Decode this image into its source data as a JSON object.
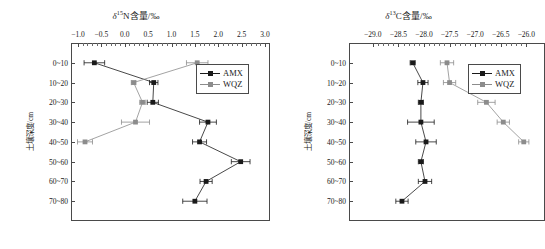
{
  "figure": {
    "panels": [
      {
        "id": "left",
        "title_prefix": "δ",
        "title_sup": "15",
        "title_rest": "N含量/‰",
        "title_plain": "δ15N含量/‰"
      },
      {
        "id": "right",
        "title_prefix": "δ",
        "title_sup": "13",
        "title_rest": "C含量/‰",
        "title_plain": "δ13C含量/‰"
      }
    ]
  },
  "legend": {
    "position": "top-right-inside",
    "items": [
      {
        "label": "AMX",
        "color": "#1a1a1a"
      },
      {
        "label": "WQZ",
        "color": "#8c8c8c"
      }
    ]
  },
  "colors": {
    "amx": "#1a1a1a",
    "wqz": "#8c8c8c",
    "axis": "#4a4a4a",
    "background": "#ffffff"
  },
  "chart_data": [
    {
      "type": "line",
      "id": "delta15N",
      "title": "δ15N含量/‰",
      "xlabel": "δ15N含量/‰",
      "ylabel": "土壤深度/cm",
      "orientation": "horizontal-value-vertical-depth",
      "xlim": [
        -1.0,
        3.0
      ],
      "xticks": [
        -1.0,
        -0.5,
        0.0,
        0.5,
        1.0,
        1.5,
        2.0,
        2.5,
        3.0
      ],
      "xtick_labels": [
        "−1.0",
        "−0.5",
        "0.0",
        "0.5",
        "1.0",
        "1.5",
        "2.0",
        "2.5",
        "3.0"
      ],
      "minor_ticks_per_interval": 4,
      "categories": [
        "0~10",
        "10~20",
        "20~30",
        "30~40",
        "40~50",
        "50~60",
        "60~70",
        "70~80"
      ],
      "grid": false,
      "legend_position": "upper right",
      "series": [
        {
          "name": "AMX",
          "color": "#1a1a1a",
          "values": [
            -0.65,
            0.62,
            0.6,
            1.78,
            1.6,
            2.48,
            1.74,
            1.5
          ],
          "errors": [
            0.22,
            0.09,
            0.12,
            0.18,
            0.15,
            0.2,
            0.13,
            0.26
          ]
        },
        {
          "name": "WQZ",
          "color": "#8c8c8c",
          "values": [
            1.55,
            0.19,
            0.38,
            0.23,
            -0.85,
            null,
            null,
            null
          ],
          "errors": [
            0.23,
            0.05,
            0.06,
            0.3,
            0.16,
            null,
            null,
            null
          ]
        }
      ]
    },
    {
      "type": "line",
      "id": "delta13C",
      "title": "δ13C含量/‰",
      "xlabel": "δ13C含量/‰",
      "ylabel": "土壤深度/cm",
      "orientation": "horizontal-value-vertical-depth",
      "xlim": [
        -29.25,
        -25.85
      ],
      "xticks": [
        -29.0,
        -28.5,
        -28.0,
        -27.5,
        -27.0,
        -26.5,
        -26.0
      ],
      "xtick_labels": [
        "−29.0",
        "−28.5",
        "−28.0",
        "−27.5",
        "−27.0",
        "−26.5",
        "−26.0"
      ],
      "minor_ticks_per_interval": 4,
      "categories": [
        "0~10",
        "10~20",
        "20~30",
        "30~40",
        "40~50",
        "50~60",
        "60~70",
        "70~80"
      ],
      "grid": false,
      "legend_position": "upper right",
      "series": [
        {
          "name": "AMX",
          "color": "#1a1a1a",
          "values": [
            -28.22,
            -28.02,
            -28.06,
            -28.06,
            -27.96,
            -28.06,
            -27.98,
            -28.43
          ],
          "errors": [
            0.05,
            0.1,
            0.05,
            0.26,
            0.2,
            0.05,
            0.13,
            0.12
          ]
        },
        {
          "name": "WQZ",
          "color": "#8c8c8c",
          "values": [
            -27.55,
            -27.5,
            -26.78,
            -26.45,
            -26.05,
            null,
            null,
            null
          ],
          "errors": [
            0.13,
            0.12,
            0.17,
            0.12,
            0.1,
            null,
            null,
            null
          ]
        }
      ]
    }
  ],
  "axes": {
    "y_axis_label": "土壤深度/cm",
    "depth_categories": [
      "0~10",
      "10~20",
      "20~30",
      "30~40",
      "40~50",
      "50~60",
      "60~70",
      "70~80"
    ]
  }
}
